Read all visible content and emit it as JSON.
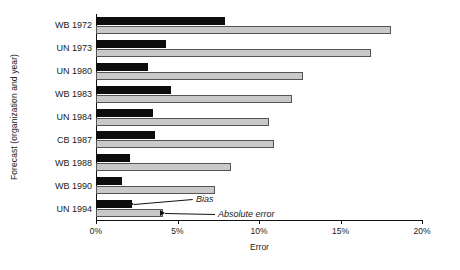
{
  "chart_data": {
    "type": "bar",
    "orientation": "horizontal",
    "title": "",
    "xlabel": "Error",
    "ylabel": "Forecast (organization and year)",
    "xlim": [
      0,
      20
    ],
    "xunit": "%",
    "xticks": [
      "0%",
      "5%",
      "10%",
      "15%",
      "20%"
    ],
    "xtick_values": [
      0,
      5,
      10,
      15,
      20
    ],
    "grid": false,
    "legend_position": "inline-annotation",
    "categories": [
      "WB 1972",
      "UN 1973",
      "UN 1980",
      "WB 1983",
      "UN 1984",
      "CB 1987",
      "WB 1988",
      "WB 1990",
      "UN 1994"
    ],
    "series": [
      {
        "name": "Bias",
        "color": "#0d0d0d",
        "values": [
          7.9,
          4.3,
          3.2,
          4.6,
          3.5,
          3.6,
          2.1,
          1.6,
          2.2
        ]
      },
      {
        "name": "Absolute error",
        "color": "#c9c9c9",
        "values": [
          18.1,
          16.9,
          12.7,
          12.0,
          10.6,
          10.9,
          8.3,
          7.3,
          4.1
        ]
      }
    ],
    "annotations": [
      {
        "text": "Bias",
        "target_category": "UN 1994",
        "target_series": "Bias"
      },
      {
        "text": "Absolute error",
        "target_category": "UN 1994",
        "target_series": "Absolute error"
      }
    ]
  }
}
